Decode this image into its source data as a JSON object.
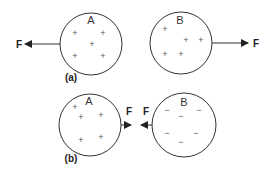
{
  "colors": {
    "stroke": "#333333",
    "text": "#222222",
    "charge": "#555555",
    "background": "#ffffff"
  },
  "panels": [
    {
      "label": "(a)",
      "spheres": [
        {
          "name": "A",
          "charge_symbol": "+",
          "charge_count": 5,
          "force": {
            "label": "F",
            "direction": "left"
          }
        },
        {
          "name": "B",
          "charge_symbol": "+",
          "charge_count": 5,
          "force": {
            "label": "F",
            "direction": "right"
          }
        }
      ],
      "interaction": "repulsion"
    },
    {
      "label": "(b)",
      "spheres": [
        {
          "name": "A",
          "charge_symbol": "+",
          "charge_count": 5,
          "force": {
            "label": "F",
            "direction": "right"
          }
        },
        {
          "name": "B",
          "charge_symbol": "−",
          "charge_count": 6,
          "force": {
            "label": "F",
            "direction": "left"
          }
        }
      ],
      "interaction": "attraction"
    }
  ]
}
